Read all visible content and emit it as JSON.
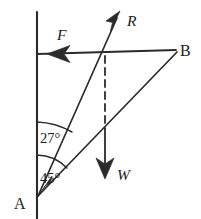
{
  "figure": {
    "type": "force-diagram",
    "background_color": "#ffffff",
    "ink_color": "#2b2b2b",
    "width": 201,
    "height": 219
  },
  "points": {
    "a": {
      "label": "A",
      "x": 38,
      "y": 196,
      "label_x": 16,
      "label_y": 203
    },
    "b": {
      "label": "B",
      "x": 176,
      "y": 50,
      "label_x": 180,
      "label_y": 50
    }
  },
  "vectors": [
    {
      "key": "r",
      "label": "R",
      "description": "reaction-force-arrow",
      "direction": "up-right",
      "tail_x": 38,
      "tail_y": 196,
      "tip_x": 120,
      "tip_y": 12,
      "label_x": 127,
      "label_y": 21
    },
    {
      "key": "f",
      "label": "F",
      "description": "friction-force-arrow",
      "direction": "left",
      "tail_x": 176,
      "tail_y": 54,
      "tip_x": 48,
      "tip_y": 54,
      "label_x": 57,
      "label_y": 37
    },
    {
      "key": "w",
      "label": "W",
      "description": "weight-force-arrow",
      "direction": "down",
      "tail_x": 105,
      "tail_y": 54,
      "tip_x": 105,
      "tip_y": 178,
      "label_x": 117,
      "label_y": 175
    }
  ],
  "angles": [
    {
      "key": "upper",
      "label": "27°",
      "value": 27,
      "unit": "degrees",
      "from": "vertical-wall",
      "to": "ray-R",
      "label_x": 40,
      "label_y": 137
    },
    {
      "key": "lower",
      "label": "45°",
      "value": 45,
      "unit": "degrees",
      "from": "vertical-wall",
      "to": "ray-AB",
      "label_x": 40,
      "label_y": 177
    }
  ],
  "lines": {
    "wall": {
      "name": "vertical-wall",
      "x1": 37,
      "y1": 14,
      "x2": 37,
      "y2": 219
    },
    "horizontal": {
      "name": "horizontal-line-to-B",
      "x1": 37,
      "y1": 54,
      "x2": 176,
      "y2": 50
    },
    "ray_ab": {
      "name": "ray-A-to-B",
      "x1": 38,
      "y1": 196,
      "x2": 176,
      "y2": 52
    },
    "ray_ar": {
      "name": "ray-A-to-R",
      "x1": 38,
      "y1": 196,
      "x2": 118,
      "y2": 16
    },
    "dashed": {
      "name": "dashed-vertical-drop",
      "x1": 105,
      "y1": 56,
      "x2": 105,
      "y2": 130
    }
  }
}
